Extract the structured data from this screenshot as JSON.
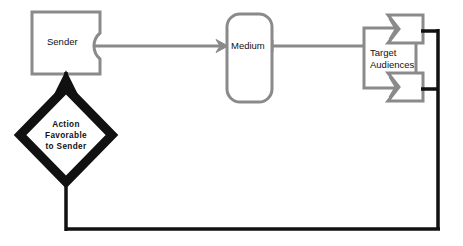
{
  "diagram": {
    "background_color": "#ffffff",
    "gray_stroke_color": "#8a8a8a",
    "black_stroke_color": "#111111",
    "nodes": [
      {
        "id": "sender",
        "label": "Sender",
        "shape": "flag-banner",
        "icon_name": "sender-node"
      },
      {
        "id": "medium",
        "label": "Medium",
        "shape": "rounded-rectangle",
        "icon_name": "medium-node"
      },
      {
        "id": "target-audiences",
        "label_line1": "Target",
        "label_line2": "Audiences",
        "shape": "rectangle-with-chevrons",
        "icon_name": "target-audiences-node"
      },
      {
        "id": "action-favorable",
        "label_line1": "Action",
        "label_line2": "Favorable",
        "label_line3": "to  Sender",
        "shape": "diamond",
        "icon_name": "decision-diamond-node"
      }
    ],
    "connectors": [
      {
        "id": "sender-to-medium",
        "from": "sender",
        "to": "medium",
        "style": "gray",
        "arrowhead": "at-target"
      },
      {
        "id": "medium-to-target",
        "from": "medium",
        "to": "target-audiences",
        "style": "gray",
        "arrowhead": "none"
      },
      {
        "id": "target-feedback",
        "from": "target-audiences",
        "to": "action-favorable",
        "style": "black-thick",
        "arrowhead": "at-target"
      },
      {
        "id": "action-to-sender",
        "from": "action-favorable",
        "to": "sender",
        "style": "black-thick",
        "arrowhead": "at-target"
      }
    ]
  }
}
